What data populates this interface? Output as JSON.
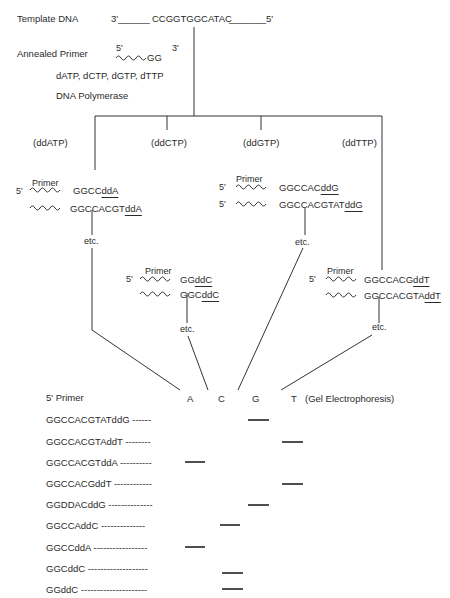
{
  "header": {
    "template_label": "Template DNA",
    "template_3prime": "3'",
    "template_blank_left": "______",
    "template_seq": "CCGGTGGCATAC",
    "template_blank_right": "_______",
    "template_5prime": "5'",
    "primer_label": "Annealed Primer",
    "primer_5prime": "5'",
    "primer_seq": "GG",
    "primer_3prime": "3'",
    "nucleotides": "dATP, dCTP, dGTP, dTTP",
    "enzyme": "DNA Polymerase"
  },
  "reactions": [
    {
      "name": "ddATP",
      "label": "(ddATP)",
      "primer_word": "Primer",
      "five_prime": "5'",
      "products": [
        {
          "prefix": "GGCC",
          "terminator": "ddA"
        },
        {
          "prefix": "GGCCACGT",
          "terminator": "ddA"
        }
      ],
      "etc": "etc."
    },
    {
      "name": "ddCTP",
      "label": "(ddCTP)",
      "primer_word": "Primer",
      "five_prime": "5'",
      "products": [
        {
          "prefix": "GG",
          "terminator": "ddC"
        },
        {
          "prefix": "GGC",
          "terminator": "ddC"
        }
      ],
      "etc": "etc."
    },
    {
      "name": "ddGTP",
      "label": "(ddGTP)",
      "primer_word": "Primer",
      "five_prime": "5'",
      "five_prime_2": "5'",
      "products": [
        {
          "prefix": "GGCCAC",
          "terminator": "ddG"
        },
        {
          "prefix": "GGCCACGTAT",
          "terminator": "ddG"
        }
      ],
      "etc": "etc."
    },
    {
      "name": "ddTTP",
      "label": "(ddTTP)",
      "primer_word": "Primer",
      "five_prime": "5'",
      "products": [
        {
          "prefix": "GGCCACG",
          "terminator": "ddT"
        },
        {
          "prefix": "GGCCACGTA",
          "terminator": "ddT"
        }
      ],
      "etc": "etc."
    }
  ],
  "gel": {
    "primer_header": "5' Primer",
    "lanes": [
      "A",
      "C",
      "G",
      "T"
    ],
    "title": "(Gel Electrophoresis)",
    "fragments": [
      {
        "label": "GGCCACGTATddG ------",
        "lane": "G"
      },
      {
        "label": "GGCCACGTAddT --------",
        "lane": "T"
      },
      {
        "label": "GGCCACGTddA ----------",
        "lane": "A"
      },
      {
        "label": "GGCCACGddT ------------",
        "lane": "T"
      },
      {
        "label": "GGDDACddG --------------",
        "lane": "G"
      },
      {
        "label": "GGCCAddC  --------------",
        "lane": "C"
      },
      {
        "label": "GGCCddA -----------------",
        "lane": "A"
      },
      {
        "label": "GGCddC -------------------",
        "lane": "C"
      },
      {
        "label": "GGddC ---------------------",
        "lane": "C"
      }
    ]
  }
}
